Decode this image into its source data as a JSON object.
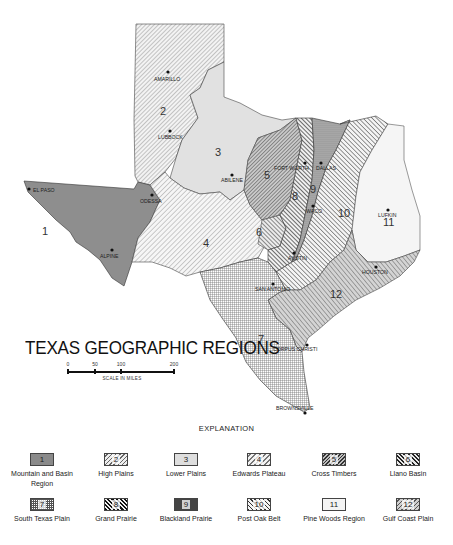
{
  "map": {
    "title": "TEXAS GEOGRAPHIC REGIONS",
    "scale": {
      "ticks": [
        "0",
        "50",
        "100",
        "200"
      ],
      "caption": "SCALE IN MILES"
    },
    "cities": {
      "amarillo": "AMARILLO",
      "lubbock": "LUBBOCK",
      "el_paso": "EL PASO",
      "odessa": "ODESSA",
      "alpine": "ALPINE",
      "abilene": "ABILENE",
      "fort_worth": "FORT WORTH",
      "dallas": "DALLAS",
      "waco": "WACO",
      "austin": "AUSTIN",
      "san_antonio": "SAN ANTONIO",
      "lufkin": "LUFKIN",
      "houston": "HOUSTON",
      "corpus_christi": "CORPUS CHRISTI",
      "brownsville": "BROWNSVILLE"
    },
    "region_numbers": {
      "r1": "1",
      "r2": "2",
      "r3": "3",
      "r4": "4",
      "r5": "5",
      "r6": "6",
      "r7": "7",
      "r8": "8",
      "r9": "9",
      "r10": "10",
      "r11": "11",
      "r12": "12"
    }
  },
  "legend": {
    "heading": "EXPLANATION",
    "items": [
      {
        "num": "1",
        "label": "Mountain and Basin Region"
      },
      {
        "num": "2",
        "label": "High Plains"
      },
      {
        "num": "3",
        "label": "Lower Plains"
      },
      {
        "num": "4",
        "label": "Edwards Plateau"
      },
      {
        "num": "5",
        "label": "Cross Timbers"
      },
      {
        "num": "6",
        "label": "Llano Basin"
      },
      {
        "num": "7",
        "label": "South Texas Plain"
      },
      {
        "num": "8",
        "label": "Grand Prairie"
      },
      {
        "num": "9",
        "label": "Blackland Prairie"
      },
      {
        "num": "10",
        "label": "Post Oak Belt"
      },
      {
        "num": "11",
        "label": "Pine Woods Region"
      },
      {
        "num": "12",
        "label": "Gulf Coast Plain"
      }
    ]
  }
}
